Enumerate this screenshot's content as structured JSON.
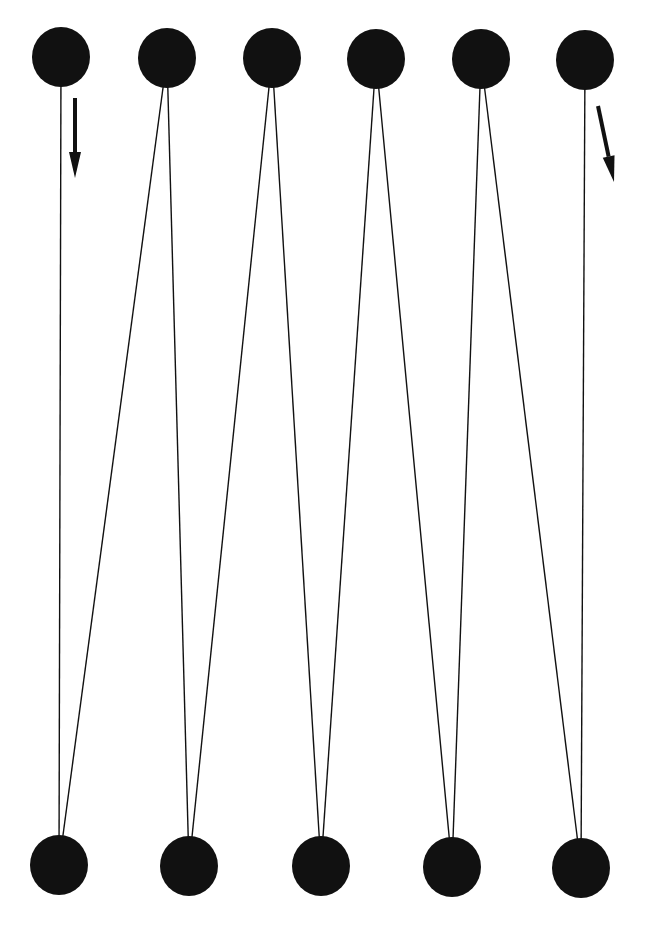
{
  "diagram": {
    "title": "",
    "colors": {
      "node": "#111111",
      "edge": "#111111",
      "background": "#ffffff"
    },
    "node_radius": {
      "rx": 29,
      "ry": 30
    },
    "top_nodes": [
      {
        "id": "T1",
        "x": 61,
        "y": 57
      },
      {
        "id": "T2",
        "x": 167,
        "y": 58
      },
      {
        "id": "T3",
        "x": 272,
        "y": 58
      },
      {
        "id": "T4",
        "x": 376,
        "y": 59
      },
      {
        "id": "T5",
        "x": 481,
        "y": 59
      },
      {
        "id": "T6",
        "x": 585,
        "y": 60
      }
    ],
    "bottom_nodes": [
      {
        "id": "B1",
        "x": 59,
        "y": 865
      },
      {
        "id": "B2",
        "x": 189,
        "y": 866
      },
      {
        "id": "B3",
        "x": 321,
        "y": 866
      },
      {
        "id": "B4",
        "x": 452,
        "y": 867
      },
      {
        "id": "B5",
        "x": 581,
        "y": 868
      }
    ],
    "path_order": [
      "T1",
      "B1",
      "T2",
      "B2",
      "T3",
      "B3",
      "T4",
      "B4",
      "T5",
      "B5",
      "T6"
    ],
    "arrows": [
      {
        "name": "start-direction-arrow",
        "x1": 75,
        "y1": 98,
        "x2": 75,
        "y2": 178
      },
      {
        "name": "end-direction-arrow",
        "x1": 598,
        "y1": 106,
        "x2": 614,
        "y2": 182
      }
    ]
  }
}
